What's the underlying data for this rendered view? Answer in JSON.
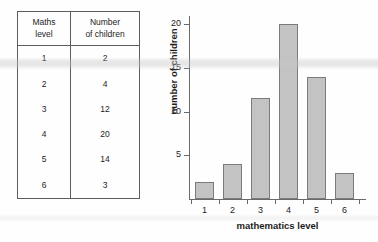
{
  "table": {
    "name": "frequency-table",
    "headers": [
      {
        "line1": "Maths",
        "line2": "level"
      },
      {
        "line1": "Number",
        "line2": "of children"
      }
    ],
    "rows": [
      {
        "level": "1",
        "count": "2"
      },
      {
        "level": "2",
        "count": "4"
      },
      {
        "level": "3",
        "count": "12"
      },
      {
        "level": "4",
        "count": "20"
      },
      {
        "level": "5",
        "count": "14"
      },
      {
        "level": "6",
        "count": "3"
      }
    ]
  },
  "chart_data": {
    "type": "bar",
    "title": "",
    "categories": [
      "1",
      "2",
      "3",
      "4",
      "5",
      "6"
    ],
    "values": [
      2,
      4,
      11.5,
      20,
      14,
      3
    ],
    "xlabel": "mathematics level",
    "ylabel": "number of children",
    "ylim": [
      0,
      21
    ],
    "yticks": [
      5,
      10,
      15,
      20
    ],
    "ytick_labels": [
      "5",
      "10",
      "15",
      "20"
    ],
    "grid": false,
    "legend": false,
    "bar_fill": "#c3c3c3",
    "bar_edge": "#7b7b7b",
    "axis_color": "#6a6a6a"
  }
}
